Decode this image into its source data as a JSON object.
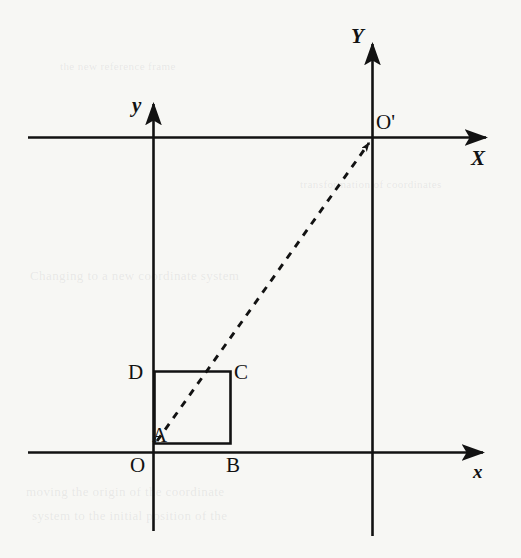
{
  "figure": {
    "type": "geometry-diagram",
    "background_color": "#f7f7f4",
    "ink_color": "#121212"
  },
  "labels": {
    "y_axis_small": "y",
    "x_axis_small": "x",
    "origin_small": "O",
    "Y_axis_big": "Y",
    "X_axis_big": "X",
    "origin_big": "O'",
    "vertex_a": "A",
    "vertex_b": "B",
    "vertex_c": "C",
    "vertex_d": "D"
  },
  "geometry": {
    "small_frame": {
      "origin": {
        "x": 153,
        "y": 452
      },
      "x_axis": {
        "x1": 28,
        "y1": 452,
        "x2": 491,
        "y2": 452,
        "arrow": "right"
      },
      "y_axis": {
        "x1": 153,
        "y1": 531,
        "x2": 153,
        "y2": 96,
        "arrow": "up"
      }
    },
    "big_frame": {
      "origin": {
        "x": 372,
        "y": 137
      },
      "X_axis": {
        "x1": 28,
        "y1": 137,
        "x2": 493,
        "y2": 137,
        "arrow": "right"
      },
      "Y_axis": {
        "x1": 372,
        "y1": 536,
        "x2": 372,
        "y2": 36,
        "arrow": "up"
      }
    },
    "square": {
      "A": {
        "x": 154,
        "y": 443
      },
      "B": {
        "x": 230,
        "y": 443
      },
      "C": {
        "x": 230,
        "y": 371
      },
      "D": {
        "x": 154,
        "y": 371
      }
    },
    "dashed_arrow": {
      "from": "A",
      "to": "O'",
      "x1": 157,
      "y1": 441,
      "x2": 369,
      "y2": 143,
      "style": "dashed",
      "arrow": "end"
    }
  },
  "label_positions": {
    "y_small": {
      "x": 132,
      "y": 95
    },
    "x_small": {
      "x": 473,
      "y": 462
    },
    "O_small": {
      "x": 130,
      "y": 455
    },
    "Y_big": {
      "x": 351,
      "y": 26
    },
    "X_big": {
      "x": 471,
      "y": 148
    },
    "O_big": {
      "x": 376,
      "y": 112
    },
    "A": {
      "x": 152,
      "y": 425
    },
    "B": {
      "x": 226,
      "y": 455
    },
    "C": {
      "x": 234,
      "y": 362
    },
    "D": {
      "x": 128,
      "y": 362
    }
  },
  "ghost_text": {
    "line1": "Changing to a new coordinate system",
    "line2": "moving the origin of the coordinate",
    "line3": "system to the initial position of the",
    "line4": "transformation of coordinates",
    "line5": "the new reference frame"
  }
}
